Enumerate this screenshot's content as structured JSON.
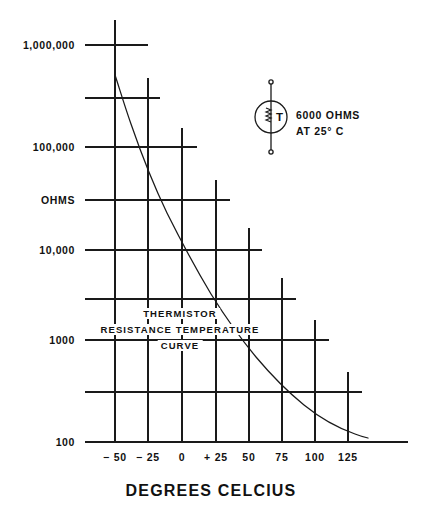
{
  "figure": {
    "axis_title": "DEGREES CELCIUS",
    "y_axis_label": "OHMS",
    "annotation_lines": [
      "THERMISTOR",
      "RESISTANCE  TEMPERATURE",
      "CURVE"
    ]
  },
  "legend": {
    "symbol_letter": "T",
    "line1": "6000   OHMS",
    "line2": "AT 25° C"
  },
  "chart_data": {
    "type": "line",
    "xlabel": "DEGREES CELCIUS",
    "ylabel": "OHMS",
    "yscale": "log",
    "ylim": [
      100,
      1000000
    ],
    "xlim": [
      -50,
      140
    ],
    "grid": true,
    "legend_position": "upper-right-inset",
    "x_ticks": [
      {
        "value": -50,
        "label": "− 50",
        "px": 115
      },
      {
        "value": -25,
        "label": "− 25",
        "px": 148
      },
      {
        "value": 0,
        "label": "0",
        "px": 182
      },
      {
        "value": 25,
        "label": "+ 25",
        "px": 216
      },
      {
        "value": 50,
        "label": "50",
        "px": 249
      },
      {
        "value": 75,
        "label": "75",
        "px": 282
      },
      {
        "value": 100,
        "label": "100",
        "px": 315
      },
      {
        "value": 125,
        "label": "125",
        "px": 348
      }
    ],
    "y_ticks": [
      {
        "value": 1000000,
        "label": "1,000,000",
        "px": 45
      },
      {
        "value": 300000,
        "label": "",
        "px": 98
      },
      {
        "value": 100000,
        "label": "100,000",
        "px": 147
      },
      {
        "value": 30000,
        "label": "",
        "px": 200
      },
      {
        "value": 10000,
        "label": "10,000",
        "px": 250
      },
      {
        "value": 3000,
        "label": "",
        "px": 299
      },
      {
        "value": 1000,
        "label": "1000",
        "px": 340
      },
      {
        "value": 300,
        "label": "",
        "px": 392
      },
      {
        "value": 100,
        "label": "100",
        "px": 442
      }
    ],
    "series": [
      {
        "name": "Thermistor resistance",
        "points": [
          {
            "x": -50,
            "y": 300000
          },
          {
            "x": -40,
            "y": 150000
          },
          {
            "x": -25,
            "y": 60000
          },
          {
            "x": -10,
            "y": 25000
          },
          {
            "x": 0,
            "y": 16000
          },
          {
            "x": 25,
            "y": 6000
          },
          {
            "x": 50,
            "y": 2600
          },
          {
            "x": 75,
            "y": 1100
          },
          {
            "x": 100,
            "y": 520
          },
          {
            "x": 125,
            "y": 260
          },
          {
            "x": 140,
            "y": 190
          }
        ]
      }
    ],
    "curve_px": "M115,75 C119,87 124,104 131,124 C141,153 154,186 167,213 C181,241 196,269 211,294 C226,318 241,339 256,357 C272,376 288,392 304,405 C320,418 338,428 355,434 C360,436 364,437 368,438",
    "gridline_segments": {
      "note": "staircase grid: each horizontal row stops just past the curve, each vertical column starts just above the curve",
      "horizontals": [
        {
          "y": 45,
          "x1": 85,
          "x2": 148
        },
        {
          "y": 98,
          "x1": 85,
          "x2": 160
        },
        {
          "y": 147,
          "x1": 85,
          "x2": 197
        },
        {
          "y": 200,
          "x1": 85,
          "x2": 230
        },
        {
          "y": 250,
          "x1": 85,
          "x2": 262
        },
        {
          "y": 299,
          "x1": 85,
          "x2": 296
        },
        {
          "y": 340,
          "x1": 85,
          "x2": 329
        },
        {
          "y": 392,
          "x1": 85,
          "x2": 362
        },
        {
          "y": 442,
          "x1": 85,
          "x2": 408
        }
      ],
      "verticals": [
        {
          "x": 115,
          "y1": 20,
          "y2": 442
        },
        {
          "x": 148,
          "y1": 78,
          "y2": 442
        },
        {
          "x": 182,
          "y1": 128,
          "y2": 442
        },
        {
          "x": 216,
          "y1": 180,
          "y2": 442
        },
        {
          "x": 249,
          "y1": 228,
          "y2": 442
        },
        {
          "x": 282,
          "y1": 278,
          "y2": 442
        },
        {
          "x": 315,
          "y1": 320,
          "y2": 442
        },
        {
          "x": 348,
          "y1": 372,
          "y2": 442
        }
      ]
    }
  }
}
